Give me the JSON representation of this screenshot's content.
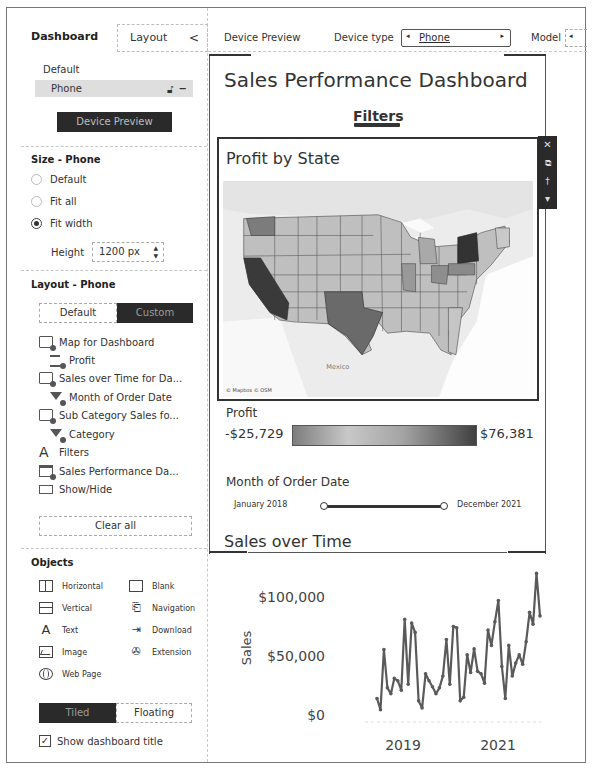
{
  "left_panel": {
    "tabs": [
      {
        "label": "Dashboard",
        "active": true
      },
      {
        "label": "Layout",
        "active": false
      }
    ],
    "collapse_icon": "chevron-left-icon",
    "device": {
      "default_label": "Default",
      "selected_device": "Phone",
      "lock_icon": "lock-icon",
      "more_icon": "more-icon",
      "preview_button": "Device Preview"
    },
    "size": {
      "title": "Size - Phone",
      "options": [
        {
          "label": "Default",
          "selected": false
        },
        {
          "label": "Fit all",
          "selected": false
        },
        {
          "label": "Fit width",
          "selected": true
        }
      ],
      "height_label": "Height",
      "height_value": "1200 px"
    },
    "layout": {
      "title": "Layout - Phone",
      "segments": [
        {
          "label": "Default",
          "active": false
        },
        {
          "label": "Custom",
          "active": true
        }
      ],
      "items": [
        {
          "label": "Map for Dashboard",
          "icon": "sheet-icon",
          "indent": 0
        },
        {
          "label": "Profit",
          "icon": "legend-icon",
          "indent": 1
        },
        {
          "label": "Sales over Time for Da...",
          "icon": "sheet-icon",
          "indent": 0
        },
        {
          "label": "Month of Order Date",
          "icon": "filter-icon",
          "indent": 1
        },
        {
          "label": "Sub Category Sales fo...",
          "icon": "sheet-icon",
          "indent": 0
        },
        {
          "label": "Category",
          "icon": "filter-icon",
          "indent": 1
        },
        {
          "label": "Filters",
          "icon": "text-icon",
          "indent": 0
        },
        {
          "label": "Sales Performance Da...",
          "icon": "title-icon",
          "indent": 0
        },
        {
          "label": "Show/Hide",
          "icon": "show-hide-icon",
          "indent": 0
        }
      ],
      "clear_all": "Clear all"
    },
    "objects": {
      "title": "Objects",
      "items": [
        {
          "label": "Horizontal",
          "icon": "horizontal-icon"
        },
        {
          "label": "Blank",
          "icon": "blank-icon"
        },
        {
          "label": "Vertical",
          "icon": "vertical-icon"
        },
        {
          "label": "Navigation",
          "icon": "navigation-icon"
        },
        {
          "label": "Text",
          "icon": "text-icon"
        },
        {
          "label": "Download",
          "icon": "download-icon"
        },
        {
          "label": "Image",
          "icon": "image-icon"
        },
        {
          "label": "Extension",
          "icon": "extension-icon"
        },
        {
          "label": "Web Page",
          "icon": "globe-icon"
        }
      ],
      "placement": [
        {
          "label": "Tiled",
          "active": true
        },
        {
          "label": "Floating",
          "active": false
        }
      ],
      "show_title_label": "Show dashboard title",
      "show_title_checked": true,
      "check_glyph": "✓"
    }
  },
  "topbar": {
    "device_preview_label": "Device Preview",
    "device_type_label": "Device type",
    "device_type_value": "Phone",
    "model_label": "Model",
    "arrow_left": "◂",
    "arrow_right": "▸"
  },
  "dashboard": {
    "title": "Sales Performance Dashboard",
    "filters_label": "Filters",
    "map": {
      "title": "Profit by State",
      "attribution": "© Mapbox © OSM",
      "region_label": "Mexico"
    },
    "floating_toolbar": [
      "✕",
      "⧉",
      "📌",
      "▾"
    ],
    "legend": {
      "title": "Profit",
      "min": "-$25,729",
      "max": "$76,381"
    },
    "date_filter": {
      "title": "Month of Order Date",
      "start": "January 2018",
      "end": "December 2021"
    },
    "sales_over_time_title": "Sales over Time"
  },
  "chart_data": {
    "type": "line",
    "title": "Sales over Time",
    "xlabel": "",
    "ylabel": "Sales",
    "ylim": [
      0,
      125000
    ],
    "y_ticks": [
      "$0",
      "$50,000",
      "$100,000"
    ],
    "x_ticks": [
      "2019",
      "2021"
    ],
    "x": [
      "2018-01",
      "2018-02",
      "2018-03",
      "2018-04",
      "2018-05",
      "2018-06",
      "2018-07",
      "2018-08",
      "2018-09",
      "2018-10",
      "2018-11",
      "2018-12",
      "2019-01",
      "2019-02",
      "2019-03",
      "2019-04",
      "2019-05",
      "2019-06",
      "2019-07",
      "2019-08",
      "2019-09",
      "2019-10",
      "2019-11",
      "2019-12",
      "2020-01",
      "2020-02",
      "2020-03",
      "2020-04",
      "2020-05",
      "2020-06",
      "2020-07",
      "2020-08",
      "2020-09",
      "2020-10",
      "2020-11",
      "2020-12",
      "2021-01",
      "2021-02",
      "2021-03",
      "2021-04",
      "2021-05",
      "2021-06",
      "2021-07",
      "2021-08",
      "2021-09",
      "2021-10",
      "2021-11",
      "2021-12"
    ],
    "values": [
      14000,
      4500,
      55500,
      23000,
      18000,
      31000,
      29000,
      21000,
      81000,
      26000,
      78000,
      70000,
      12000,
      6000,
      35000,
      29000,
      24000,
      18000,
      23000,
      33000,
      64000,
      26000,
      75000,
      74000,
      12000,
      15000,
      51000,
      36000,
      56000,
      37000,
      35000,
      27000,
      72000,
      59000,
      79000,
      97000,
      41000,
      14000,
      59000,
      33000,
      44000,
      51000,
      43000,
      62000,
      87000,
      77000,
      120000,
      84000
    ],
    "grid": false,
    "legend": null
  }
}
